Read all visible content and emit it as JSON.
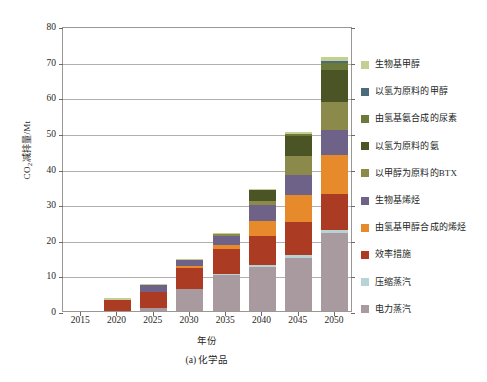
{
  "chart_data": {
    "type": "bar",
    "title": "",
    "caption": "(a) 化学品",
    "xlabel": "年份",
    "ylabel": "CO2减排量/Mt",
    "ylabel_prefix": "CO",
    "ylabel_sub": "2",
    "ylabel_suffix": "减排量/Mt",
    "stacked": true,
    "grid": true,
    "legend_position": "right",
    "ylim": [
      0,
      80
    ],
    "yticks": [
      0,
      10,
      20,
      30,
      40,
      50,
      60,
      70,
      80
    ],
    "categories": [
      "2015",
      "2020",
      "2025",
      "2030",
      "2035",
      "2040",
      "2045",
      "2050"
    ],
    "series": [
      {
        "name": "电力蒸汽",
        "color": "#a99aa0",
        "values": [
          0,
          0,
          0.8,
          6.3,
          10.0,
          12.3,
          14.8,
          21.8
        ]
      },
      {
        "name": "压缩蒸汽",
        "color": "#b9d2d4",
        "values": [
          0,
          0,
          0,
          0,
          0.5,
          0.7,
          0.8,
          0.9
        ]
      },
      {
        "name": "效率措施",
        "color": "#ab3b22",
        "values": [
          0,
          3.2,
          4.6,
          5.8,
          7.0,
          8.2,
          9.3,
          10.2
        ]
      },
      {
        "name": "由氢基甲醇合成的烯烃",
        "color": "#e78a2b",
        "values": [
          0,
          0,
          0,
          0.6,
          1.0,
          4.2,
          7.8,
          11.0
        ]
      },
      {
        "name": "生物基烯烃",
        "color": "#6f6288",
        "values": [
          0,
          0,
          1.8,
          1.6,
          2.6,
          4.4,
          5.6,
          6.9
        ]
      },
      {
        "name": "以甲醇为原料的BTX",
        "color": "#8b8a4a",
        "values": [
          0,
          0,
          0,
          0,
          0.6,
          1.0,
          5.2,
          7.8
        ]
      },
      {
        "name": "以氢为原料的氨",
        "color": "#4a5424",
        "values": [
          0,
          0,
          0,
          0,
          0,
          3.2,
          5.6,
          9.2
        ]
      },
      {
        "name": "由氢基氨合成的尿素",
        "color": "#6b7a3a",
        "values": [
          0,
          0,
          0,
          0,
          0,
          0,
          0.5,
          1.8
        ]
      },
      {
        "name": "以氢为原料的甲醇",
        "color": "#4c6b7a",
        "values": [
          0,
          0,
          0,
          0,
          0,
          0,
          0,
          0.6
        ]
      },
      {
        "name": "生物基甲醇",
        "color": "#c3cf93",
        "values": [
          0,
          0.5,
          0.3,
          0.2,
          0.2,
          0.4,
          0.6,
          1.0
        ]
      }
    ]
  },
  "legend": {
    "items": [
      {
        "label": "生物基甲醇",
        "color": "#c3cf93"
      },
      {
        "label": "以氢为原料的甲醇",
        "color": "#4c6b7a"
      },
      {
        "label": "由氢基氨合成的尿素",
        "color": "#6b7a3a"
      },
      {
        "label": "以氢为原料的氨",
        "color": "#4a5424"
      },
      {
        "label": "以甲醇为原料的BTX",
        "color": "#8b8a4a"
      },
      {
        "label": "生物基烯烃",
        "color": "#6f6288"
      },
      {
        "label": "由氢基甲醇合成的烯烃",
        "color": "#e78a2b"
      },
      {
        "label": "效率措施",
        "color": "#ab3b22"
      },
      {
        "label": "压缩蒸汽",
        "color": "#b9d2d4"
      },
      {
        "label": "电力蒸汽",
        "color": "#a99aa0"
      }
    ]
  }
}
